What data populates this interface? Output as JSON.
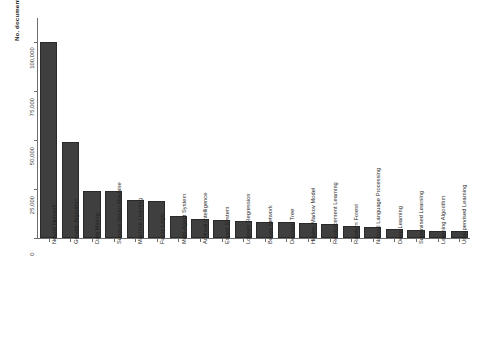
{
  "chart_data": {
    "type": "bar",
    "title": "",
    "subtitle": "",
    "xlabel": "",
    "ylabel": "No. documents",
    "ylim": [
      0,
      112000
    ],
    "grid": false,
    "legend": null,
    "orientation": "vertical",
    "bar_color": "#3f3f3f",
    "y_ticks": [
      0,
      25000,
      50000,
      75000,
      100000
    ],
    "y_tick_labels": [
      "0",
      "25,000",
      "50,000",
      "75,000",
      "100,000"
    ],
    "categories": [
      "Neural Network",
      "Genetic Algorithm",
      "Data Mining",
      "Support Vector Machine",
      "Machine Learning",
      "Fuzzy Logic",
      "Multi-Agent System",
      "Artificial Intelligence",
      "Expert System",
      "Logistic Regression",
      "Bayes Network",
      "Decision Tree",
      "Hidden Markov Model",
      "Reinforcement Learning",
      "Random Forest",
      "Natural Language Processing",
      "Deep Learning",
      "Supervised Learning",
      "Learning Algorithm",
      "Unsupervised Learning"
    ],
    "values": [
      100000,
      49000,
      24000,
      24000,
      19500,
      19000,
      11000,
      9500,
      9000,
      8500,
      8000,
      8000,
      7500,
      7000,
      6000,
      5500,
      4500,
      4000,
      3800,
      3500
    ]
  }
}
